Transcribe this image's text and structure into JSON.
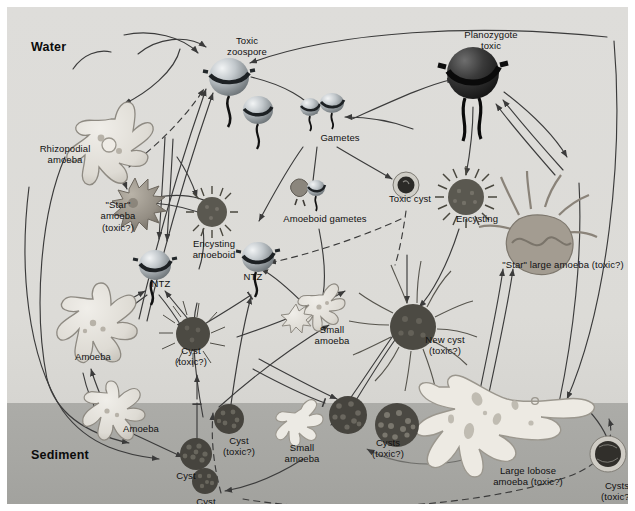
{
  "figure": {
    "type": "diagram",
    "zones": [
      {
        "id": "water",
        "label": "Water",
        "color": "#dcdbd7",
        "x": 24,
        "y": 33
      },
      {
        "id": "sediment",
        "label": "Sediment",
        "color": "#a7a7a3",
        "x": 24,
        "y": 441
      }
    ],
    "colors": {
      "water_bg": "#dcdbd7",
      "sediment_bg": "#a7a7a3",
      "page_bg": "#ffffff",
      "arrow": "#3b3b3b",
      "text": "#111111",
      "zoospore_light": "#cfd3d6",
      "zoospore_dark": "#5d6468",
      "planozygote": "#2b2b2b",
      "cyst_dark": "#4a4a4a",
      "amoeba_outline": "#8d8d87",
      "star_amoeba": "#9b958c"
    },
    "nodes": [
      {
        "id": "toxic-zoospore",
        "label": "Toxic\nzoospore",
        "x": 209,
        "y": 28,
        "w": 62,
        "stage": "zoospore"
      },
      {
        "id": "planozygote",
        "label": "Planozygote\ntoxic",
        "x": 441,
        "y": 22,
        "w": 86,
        "stage": "planozygote"
      },
      {
        "id": "gametes",
        "label": "Gametes",
        "x": 305,
        "y": 125,
        "w": 56,
        "stage": "gamete"
      },
      {
        "id": "rhizopodial-amoeba",
        "label": "Rhizopodial\namoeba",
        "x": 22,
        "y": 136,
        "w": 72,
        "stage": "amoeba"
      },
      {
        "id": "toxic-cyst",
        "label": "Toxic cyst",
        "x": 372,
        "y": 186,
        "w": 62,
        "stage": "cyst"
      },
      {
        "id": "encysting",
        "label": "Encysting",
        "x": 441,
        "y": 206,
        "w": 58,
        "stage": "encysting"
      },
      {
        "id": "star-amoeba",
        "label": "\"Star\"\namoeba\n(toxic?)",
        "x": 83,
        "y": 192,
        "w": 56,
        "stage": "amoeba"
      },
      {
        "id": "amoeboid-gametes",
        "label": "Amoeboid gametes",
        "x": 266,
        "y": 206,
        "w": 104,
        "stage": "gamete"
      },
      {
        "id": "encysting-amoeboid",
        "label": "Encysting\namoeboid",
        "x": 176,
        "y": 231,
        "w": 62,
        "stage": "encysting"
      },
      {
        "id": "ntz-left",
        "label": "NTZ",
        "x": 141,
        "y": 271,
        "w": 26,
        "stage": "zoospore"
      },
      {
        "id": "ntz-right",
        "label": "NTZ",
        "x": 233,
        "y": 264,
        "w": 26,
        "stage": "zoospore"
      },
      {
        "id": "star-large-amoeba",
        "label": "\"Star\" large amoeba (toxic?)",
        "x": 481,
        "y": 252,
        "w": 150,
        "stage": "amoeba"
      },
      {
        "id": "small-amoeba-mid",
        "label": "Small\namoeba",
        "x": 303,
        "y": 317,
        "w": 44,
        "stage": "amoeba"
      },
      {
        "id": "new-cyst",
        "label": "New cyst\n(toxic?)",
        "x": 408,
        "y": 327,
        "w": 60,
        "stage": "cyst"
      },
      {
        "id": "amoeba-water",
        "label": "Amoeba",
        "x": 63,
        "y": 344,
        "w": 46,
        "stage": "amoeba"
      },
      {
        "id": "cyst-toxic-water",
        "label": "Cyst\n(toxic?)",
        "x": 161,
        "y": 338,
        "w": 46,
        "stage": "cyst"
      },
      {
        "id": "amoeba-sediment",
        "label": "Amoeba",
        "x": 111,
        "y": 416,
        "w": 46,
        "stage": "amoeba"
      },
      {
        "id": "cyst-sediment",
        "label": "Cyst",
        "x": 163,
        "y": 463,
        "w": 32,
        "stage": "cyst"
      },
      {
        "id": "cyst-toxic-sediment",
        "label": "Cyst\n(toxic?)",
        "x": 209,
        "y": 428,
        "w": 46,
        "stage": "cyst"
      },
      {
        "id": "small-amoeba-sediment",
        "label": "Small\namoeba",
        "x": 273,
        "y": 435,
        "w": 44,
        "stage": "amoeba"
      },
      {
        "id": "cyst-bottom",
        "label": "Cyst",
        "x": 183,
        "y": 489,
        "w": 32,
        "stage": "cyst"
      },
      {
        "id": "cysts-toxic-mid",
        "label": "Cysts\n(toxic?)",
        "x": 358,
        "y": 430,
        "w": 46,
        "stage": "cyst"
      },
      {
        "id": "large-lobose-amoeba",
        "label": "Large lobose\namoeba (toxic?)",
        "x": 479,
        "y": 458,
        "w": 84,
        "stage": "amoeba"
      },
      {
        "id": "cysts-toxic-right",
        "label": "Cysts\n(toxic?)",
        "x": 587,
        "y": 473,
        "w": 46,
        "stage": "cyst"
      }
    ]
  }
}
